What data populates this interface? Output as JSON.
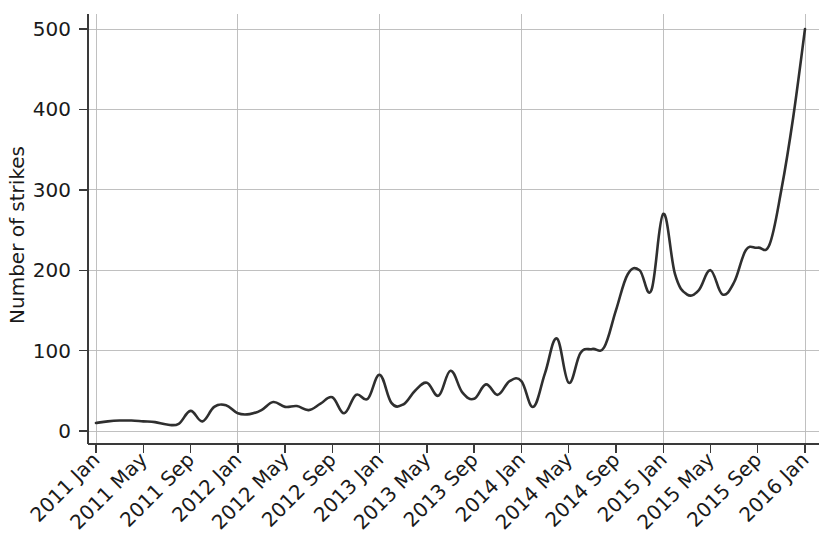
{
  "chart_data": {
    "type": "line",
    "title": "",
    "xlabel": "",
    "ylabel": "Number of strikes",
    "ylim": [
      0,
      520
    ],
    "yticks": [
      0,
      100,
      200,
      300,
      400,
      500
    ],
    "ytick_labels": [
      "0",
      "100",
      "200",
      "300",
      "400",
      "500"
    ],
    "grid": true,
    "grid_axis": "both",
    "legend": "none",
    "line_color": "#2f2f2f",
    "grid_color": "#b9b9b9",
    "axis_color": "#3a3a3a",
    "xtick_labels": [
      "2011 Jan",
      "2011 May",
      "2011 Sep",
      "2012 Jan",
      "2012 May",
      "2012 Sep",
      "2013 Jan",
      "2013 May",
      "2013 Sep",
      "2014 Jan",
      "2014 May",
      "2014 Sep",
      "2015 Jan",
      "2015 May",
      "2015 Sep",
      "2016 Jan"
    ],
    "xtick_months": [
      0,
      4,
      8,
      12,
      16,
      20,
      24,
      28,
      32,
      36,
      40,
      44,
      48,
      52,
      56,
      60
    ],
    "major_gridline_months": [
      0,
      12,
      24,
      36,
      48,
      60
    ],
    "x": [
      "2011-01",
      "2011-02",
      "2011-03",
      "2011-04",
      "2011-05",
      "2011-06",
      "2011-07",
      "2011-08",
      "2011-09",
      "2011-10",
      "2011-11",
      "2011-12",
      "2012-01",
      "2012-02",
      "2012-03",
      "2012-04",
      "2012-05",
      "2012-06",
      "2012-07",
      "2012-08",
      "2012-09",
      "2012-10",
      "2012-11",
      "2012-12",
      "2013-01",
      "2013-02",
      "2013-03",
      "2013-04",
      "2013-05",
      "2013-06",
      "2013-07",
      "2013-08",
      "2013-09",
      "2013-10",
      "2013-11",
      "2013-12",
      "2014-01",
      "2014-02",
      "2014-03",
      "2014-04",
      "2014-05",
      "2014-06",
      "2014-07",
      "2014-08",
      "2014-09",
      "2014-10",
      "2014-11",
      "2014-12",
      "2015-01",
      "2015-02",
      "2015-03",
      "2015-04",
      "2015-05",
      "2015-06",
      "2015-07",
      "2015-08",
      "2015-09",
      "2015-10",
      "2015-11",
      "2015-12",
      "2016-01"
    ],
    "values": [
      10,
      12,
      13,
      13,
      12,
      11,
      8,
      9,
      25,
      12,
      30,
      32,
      22,
      21,
      26,
      36,
      30,
      31,
      26,
      34,
      42,
      22,
      45,
      40,
      70,
      35,
      33,
      50,
      60,
      44,
      75,
      48,
      40,
      58,
      45,
      62,
      62,
      30,
      72,
      115,
      60,
      97,
      102,
      104,
      150,
      195,
      200,
      175,
      270,
      195,
      170,
      175,
      200,
      170,
      185,
      225,
      228,
      232,
      300,
      390,
      500
    ]
  }
}
